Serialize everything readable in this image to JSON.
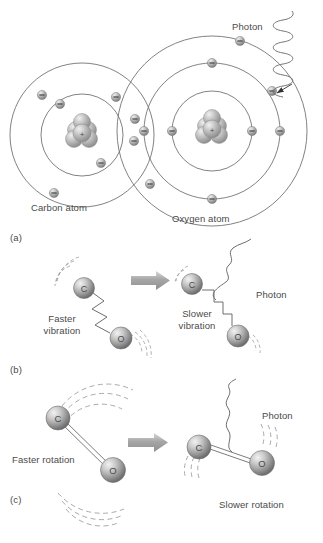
{
  "figure": {
    "background_color": "#ffffff",
    "line_color": "#5a5a5a",
    "text_color": "#4a4a4a",
    "sphere_color": "#9a9a9a",
    "arrow_color": "#b0b0b0"
  },
  "panels": [
    {
      "id": "a",
      "label": "(a)",
      "caption_labels": [
        "Carbon atom",
        "Oxygen atom",
        "Photon"
      ],
      "description": "Bohr-model carbon and oxygen atoms sharing electrons; a photon is emitted from an outer-shell electron of the oxygen atom.",
      "atoms": [
        {
          "name": "Carbon atom",
          "shells": 2,
          "electrons_per_shell": [
            2,
            4
          ]
        },
        {
          "name": "Oxygen atom",
          "shells": 3,
          "electrons_per_shell": [
            2,
            4,
            4
          ]
        }
      ]
    },
    {
      "id": "b",
      "label": "(b)",
      "caption_labels": [
        "Faster vibration",
        "Slower vibration",
        "Photon"
      ],
      "description": "A vibrating C-O molecule on a spring loses vibrational energy, going from faster vibration to slower vibration and emitting a photon.",
      "atom_labels": [
        "C",
        "O"
      ]
    },
    {
      "id": "c",
      "label": "(c)",
      "caption_labels": [
        "Faster rotation",
        "Slower rotation",
        "Photon"
      ],
      "description": "A rotating C-O molecule loses rotational energy, going from faster rotation to slower rotation and emitting a photon.",
      "atom_labels": [
        "C",
        "O"
      ]
    }
  ],
  "labels": {
    "panel_a": "(a)",
    "panel_b": "(b)",
    "panel_c": "(c)",
    "carbon_atom": "Carbon atom",
    "oxygen_atom": "Oxygen atom",
    "photon_a": "Photon",
    "faster_vibration": "Faster\nvibration",
    "faster_vibration_line1": "Faster",
    "faster_vibration_line2": "vibration",
    "slower_vibration_line1": "Slower",
    "slower_vibration_line2": "vibration",
    "photon_b": "Photon",
    "faster_rotation": "Faster rotation",
    "slower_rotation": "Slower rotation",
    "photon_c": "Photon",
    "carbon_symbol": "C",
    "oxygen_symbol": "O",
    "nucleus_charge": "+"
  }
}
